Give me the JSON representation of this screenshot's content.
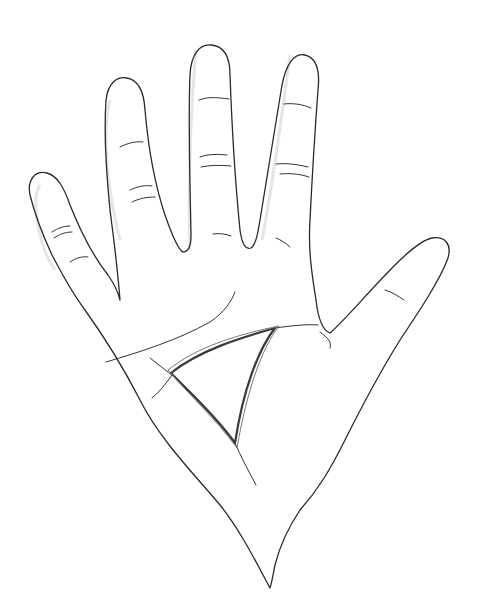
{
  "image": {
    "subject": "Line drawing of an open palm (right hand) with a triangle highlighted in the center of the palm",
    "width": 483,
    "height": 616,
    "colors": {
      "background": "#ffffff",
      "line": "#2a2a2a",
      "highlight": "#3a3a3a"
    },
    "highlight": {
      "shape": "triangle",
      "vertices": [
        [
          171,
          373
        ],
        [
          275,
          328
        ],
        [
          235,
          443
        ]
      ]
    }
  }
}
